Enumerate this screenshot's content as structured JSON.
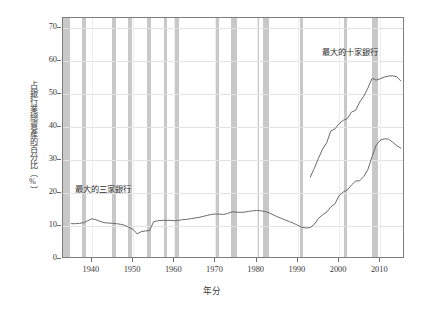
{
  "chart_data": {
    "type": "line",
    "title": "",
    "xlabel": "年分",
    "ylabel": "占銀行業總資產的百分比（%）",
    "xlim": [
      1933,
      2016
    ],
    "ylim": [
      0,
      73
    ],
    "yticks": [
      0,
      10,
      20,
      30,
      40,
      50,
      60,
      70
    ],
    "xticks": [
      1940,
      1950,
      1960,
      1970,
      1980,
      1990,
      2000,
      2010
    ],
    "ytick_labels": [
      "0",
      "10",
      "20",
      "30",
      "40",
      "50",
      "60",
      "70"
    ],
    "xtick_labels": [
      "1940",
      "1950",
      "1960",
      "1970",
      "1980",
      "1990",
      "2000",
      "2010"
    ],
    "grid": true,
    "legend_position": "inline-annotation",
    "series": [
      {
        "name": "最大的三家銀行",
        "color": "#6b6b6b",
        "annotation": "最大的三家銀行",
        "x": [
          1935,
          1936,
          1937,
          1938,
          1939,
          1940,
          1941,
          1942,
          1943,
          1944,
          1945,
          1946,
          1947,
          1948,
          1949,
          1950,
          1951,
          1952,
          1953,
          1954,
          1955,
          1956,
          1957,
          1958,
          1959,
          1960,
          1961,
          1962,
          1963,
          1964,
          1965,
          1966,
          1967,
          1968,
          1969,
          1970,
          1971,
          1972,
          1973,
          1974,
          1975,
          1976,
          1977,
          1978,
          1979,
          1980,
          1981,
          1982,
          1983,
          1984,
          1985,
          1986,
          1987,
          1988,
          1989,
          1990,
          1991,
          1992,
          1993,
          1994,
          1995,
          1996,
          1997,
          1998,
          1999,
          2000,
          2001,
          2002,
          2003,
          2004,
          2005,
          2006,
          2007,
          2008,
          2009,
          2010,
          2011,
          2012,
          2013,
          2014,
          2015
        ],
        "values": [
          10.7,
          10.7,
          10.8,
          11.0,
          11.6,
          12.2,
          11.9,
          11.4,
          11.0,
          10.9,
          10.8,
          10.7,
          10.5,
          10.2,
          9.6,
          9.0,
          7.6,
          8.3,
          8.5,
          8.6,
          11.3,
          11.6,
          11.7,
          11.7,
          11.7,
          11.6,
          11.7,
          11.9,
          12.0,
          12.2,
          12.4,
          12.6,
          12.9,
          13.2,
          13.5,
          13.6,
          13.6,
          13.5,
          13.8,
          14.3,
          14.2,
          14.1,
          14.2,
          14.4,
          14.6,
          14.7,
          14.6,
          14.4,
          14.0,
          13.4,
          12.8,
          12.3,
          11.8,
          11.3,
          10.8,
          10.2,
          9.6,
          9.4,
          9.5,
          10.5,
          12.3,
          13.4,
          14.2,
          15.8,
          16.7,
          19.2,
          20.3,
          20.9,
          22.4,
          23.6,
          23.7,
          25.0,
          27.1,
          31.0,
          34.5,
          36.0,
          36.4,
          36.3,
          35.4,
          34.3,
          33.6
        ]
      },
      {
        "name": "最大的十家銀行",
        "color": "#6b6b6b",
        "annotation": "最大的十家銀行",
        "x": [
          1993,
          1994,
          1995,
          1996,
          1997,
          1998,
          1999,
          2000,
          2001,
          2002,
          2003,
          2004,
          2005,
          2006,
          2007,
          2008,
          2009,
          2010,
          2011,
          2012,
          2013,
          2014,
          2015
        ],
        "values": [
          24.8,
          27.5,
          30.5,
          33.3,
          35.2,
          38.8,
          39.4,
          41.0,
          42.0,
          42.5,
          44.5,
          45.0,
          47.5,
          49.3,
          51.8,
          54.7,
          54.2,
          54.6,
          55.1,
          55.4,
          55.5,
          55.2,
          53.9
        ]
      }
    ],
    "recession_bands": [
      {
        "start": 1933.0,
        "end": 1934.8
      },
      {
        "start": 1937.6,
        "end": 1938.6
      },
      {
        "start": 1945.0,
        "end": 1945.8
      },
      {
        "start": 1948.8,
        "end": 1949.8
      },
      {
        "start": 1953.4,
        "end": 1954.4
      },
      {
        "start": 1957.5,
        "end": 1958.3
      },
      {
        "start": 1960.2,
        "end": 1961.1
      },
      {
        "start": 1969.9,
        "end": 1970.9
      },
      {
        "start": 1973.8,
        "end": 1975.2
      },
      {
        "start": 1980.0,
        "end": 1980.6
      },
      {
        "start": 1981.5,
        "end": 1982.9
      },
      {
        "start": 1990.5,
        "end": 1991.2
      },
      {
        "start": 2001.2,
        "end": 2001.9
      },
      {
        "start": 2007.9,
        "end": 2009.5
      }
    ],
    "band_color": "#c3c3c3",
    "line_color": "#6b6b6b",
    "frame_color": "#7d7d7d"
  },
  "annotations": {
    "ten_banks": "最大的十家銀行",
    "three_banks": "最大的三家銀行"
  },
  "axes": {
    "x_title": "年分",
    "y_title": "占銀行業總資產的百分比（%）"
  }
}
